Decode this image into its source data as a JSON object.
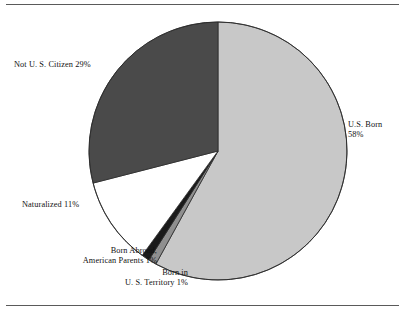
{
  "figure": {
    "name": "citizenship-status-pie-chart",
    "background": "#ffffff",
    "rule_color": "#5a5a5a"
  },
  "chart_data": {
    "type": "pie",
    "title": "",
    "subtitle": "",
    "xlabel": "",
    "ylabel": "",
    "legend_position": "none",
    "grid": false,
    "units": "percent",
    "start_angle_deg": 0,
    "direction": "clockwise",
    "center": {
      "x": 218,
      "y": 151
    },
    "radius": 129,
    "categories": [
      "U.S. Born",
      "Born in U.S. Territory",
      "Born Abroad, American Parents",
      "Naturalized",
      "Not U. S. Citizen"
    ],
    "values": [
      58,
      1,
      1,
      11,
      29
    ],
    "colors": [
      "#c8c8c8",
      "#8f8f8f",
      "#1a1a1a",
      "#ffffff",
      "#4a4a4a"
    ],
    "slices": [
      {
        "key": "us-born",
        "name": "U.S. Born",
        "value": 58,
        "value_text": "58%",
        "color": "#c8c8c8",
        "label_line_1": "U.S. Born",
        "label_line_2": "58%"
      },
      {
        "key": "us-territory",
        "name": "Born in U.S. Territory",
        "value": 1,
        "value_text": "1%",
        "color": "#8f8f8f",
        "label_line_1": "Born in",
        "label_line_2": "U. S. Territory 1%"
      },
      {
        "key": "born-abroad",
        "name": "Born Abroad, American Parents",
        "value": 1,
        "value_text": "1%",
        "color": "#1a1a1a",
        "label_line_1": "Born Abroad,",
        "label_line_2": "American Parents 1%"
      },
      {
        "key": "naturalized",
        "name": "Naturalized",
        "value": 11,
        "value_text": "11%",
        "color": "#ffffff",
        "label_line_1": "Naturalized 11%",
        "label_line_2": ""
      },
      {
        "key": "not-citizen",
        "name": "Not U. S. Citizen",
        "value": 29,
        "value_text": "29%",
        "color": "#4a4a4a",
        "label_line_1": "Not U. S. Citizen 29%",
        "label_line_2": ""
      }
    ]
  }
}
